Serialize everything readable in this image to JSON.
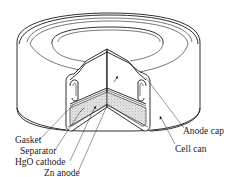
{
  "figure": {
    "labels": {
      "gasket": "Gasket",
      "separator": "Separator",
      "hgo_cathode": "HgO cathode",
      "zn_anode": "Zn anode",
      "anode_cap": "Anode cap",
      "cell_can": "Cell can"
    },
    "colors": {
      "line": "#1a1a1a",
      "background": "#ffffff",
      "stipple": "#888888"
    }
  }
}
